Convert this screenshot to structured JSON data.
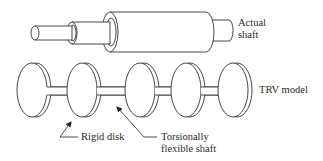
{
  "diagram": {
    "type": "engineering-illustration",
    "stroke_color": "#333333",
    "background": "#ffffff",
    "labels": {
      "actual_shaft": [
        "Actual",
        "shaft"
      ],
      "trv_model": "TRV model",
      "rigid_disk": "Rigid disk",
      "flexible_shaft": [
        "Torsionally",
        "flexible shaft"
      ]
    },
    "components": {
      "actual_shaft": {
        "description": "Stepped cylindrical shaft with large central drum",
        "sections": [
          "small end",
          "intermediate step",
          "main drum",
          "right stub"
        ]
      },
      "trv_model": {
        "description": "Lumped torsional vibration model",
        "disk_count": 5,
        "shaft_segment_count": 4
      }
    }
  }
}
